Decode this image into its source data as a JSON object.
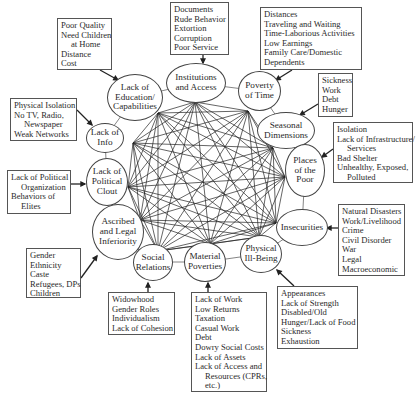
{
  "diagram": {
    "nodes": [
      {
        "id": "institutions",
        "label_lines": [
          "Institutions",
          "and Access"
        ]
      },
      {
        "id": "poverty_time",
        "label_lines": [
          "Poverty",
          "of Time"
        ]
      },
      {
        "id": "seasonal",
        "label_lines": [
          "Seasonal",
          "Dimensions"
        ]
      },
      {
        "id": "places",
        "label_lines": [
          "Places",
          "of the",
          "Poor"
        ]
      },
      {
        "id": "insecurities",
        "label_lines": [
          "Insecurities"
        ]
      },
      {
        "id": "physical",
        "label_lines": [
          "Physical",
          "Ill-Being"
        ]
      },
      {
        "id": "material",
        "label_lines": [
          "Material",
          "Poverties"
        ]
      },
      {
        "id": "social",
        "label_lines": [
          "Social",
          "Relations"
        ]
      },
      {
        "id": "ascribed",
        "label_lines": [
          "Ascribed",
          "and Legal",
          "Inferiority"
        ]
      },
      {
        "id": "political",
        "label_lines": [
          "Lack of",
          "Political",
          "Clout"
        ]
      },
      {
        "id": "info",
        "label_lines": [
          "Lack of",
          "Info"
        ]
      },
      {
        "id": "education",
        "label_lines": [
          "Lack of",
          "Education/",
          "Capabilities"
        ]
      }
    ],
    "boxes": [
      {
        "target": "education",
        "lines": [
          "Poor Quality",
          "Need Children",
          "at Home",
          "Distance",
          "Cost"
        ],
        "indent": [
          2
        ]
      },
      {
        "target": "institutions",
        "lines": [
          "Documents",
          "Rude Behavior",
          "Extortion",
          "Corruption",
          "Poor Service"
        ],
        "indent": []
      },
      {
        "target": "poverty_time",
        "lines": [
          "Distances",
          "Traveling and Waiting",
          "Time-Laborious Activities",
          "Low Earnings",
          "Family Care/Domestic",
          "Dependents"
        ],
        "indent": []
      },
      {
        "target": "seasonal",
        "lines": [
          "Sickness",
          "Work",
          "Debt",
          "Hunger"
        ],
        "indent": []
      },
      {
        "target": "info",
        "lines": [
          "Physical Isolation",
          "No TV, Radio,",
          "Newspaper",
          "Weak Networks"
        ],
        "indent": [
          2
        ]
      },
      {
        "target": "places",
        "lines": [
          "Isolation",
          "Lack of Infrastructure/",
          "Services",
          "Bad Shelter",
          "Unhealthy, Exposed,",
          "Polluted"
        ],
        "indent": [
          2,
          5
        ]
      },
      {
        "target": "political",
        "lines": [
          "Lack of Political",
          "Organization",
          "Behaviors of",
          "Elites"
        ],
        "indent": [
          1,
          3
        ]
      },
      {
        "target": "insecurities",
        "lines": [
          "Natural Disasters",
          "Work/Livelihood",
          "Crime",
          "Civil Disorder",
          "War",
          "Legal",
          "Macroeconomic"
        ],
        "indent": []
      },
      {
        "target": "ascribed",
        "lines": [
          "Gender",
          "Ethnicity",
          "Caste",
          "Refugees, DPs",
          "Children"
        ],
        "indent": []
      },
      {
        "target": "social",
        "lines": [
          "Widowhood",
          "Gender Roles",
          "Individualism",
          "Lack of Cohesion"
        ],
        "indent": []
      },
      {
        "target": "material",
        "lines": [
          "Lack of Work",
          "Low Returns",
          "Taxation",
          "Casual Work",
          "Debt",
          "Dowry Social Costs",
          "Lack of Assets",
          "Lack of Access and",
          "Resources (CPRs,",
          "etc.)"
        ],
        "indent": [
          8,
          9
        ]
      },
      {
        "target": "physical",
        "lines": [
          "Appearances",
          "Lack of Strength",
          "Disabled/Old",
          "Hunger/Lack of Food",
          "Sickness",
          "Exhaustion"
        ],
        "indent": []
      }
    ],
    "colors": {
      "line": "#222222",
      "border": "#555555",
      "text": "#2a2a2a",
      "background": "#ffffff"
    }
  }
}
